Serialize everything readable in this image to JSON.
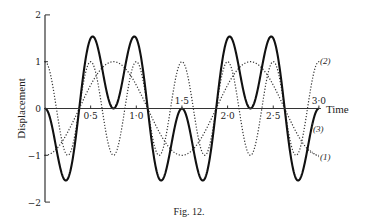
{
  "chart_data": {
    "type": "line",
    "title": "",
    "caption": "Fig. 12.",
    "xlabel": "Time",
    "ylabel": "Displacement",
    "xlim": [
      0,
      3.0
    ],
    "ylim": [
      -2,
      2
    ],
    "grid": false,
    "x_ticks": [
      {
        "value": 0.5,
        "label": "0·5",
        "placement": "below"
      },
      {
        "value": 1.0,
        "label": "1·0",
        "placement": "below"
      },
      {
        "value": 1.5,
        "label": "1·5",
        "placement": "above"
      },
      {
        "value": 2.0,
        "label": "2·0",
        "placement": "below"
      },
      {
        "value": 2.5,
        "label": "2·5",
        "placement": "below"
      },
      {
        "value": 3.0,
        "label": "3·0",
        "placement": "above"
      }
    ],
    "y_ticks": [
      {
        "value": 2,
        "label": "2"
      },
      {
        "value": 1,
        "label": "1"
      },
      {
        "value": 0,
        "label": "0"
      },
      {
        "value": -1,
        "label": "−1"
      },
      {
        "value": -2,
        "label": "−2"
      }
    ],
    "series": [
      {
        "name": "(1)",
        "label": "(1)",
        "style": "dotted",
        "formula": "-cos(4πt/3)",
        "amplitude": 1,
        "period": 1.5,
        "phase_sign": -1,
        "x": [
          0,
          0.375,
          0.75,
          1.125,
          1.5,
          1.875,
          2.25,
          2.625,
          3.0
        ],
        "y": [
          -1,
          0,
          1,
          0,
          -1,
          0,
          1,
          0,
          -1
        ]
      },
      {
        "name": "(2)",
        "label": "(2)",
        "style": "dotted",
        "formula": "cos(4πt)",
        "amplitude": 1,
        "period": 0.5,
        "phase_sign": 1,
        "x": [
          0,
          0.125,
          0.25,
          0.375,
          0.5,
          0.75,
          1.0,
          1.25,
          1.5,
          1.75,
          2.0,
          2.25,
          2.5,
          2.75,
          3.0
        ],
        "y": [
          1,
          0,
          -1,
          0,
          1,
          -1,
          1,
          -1,
          1,
          -1,
          1,
          -1,
          1,
          -1,
          1
        ]
      },
      {
        "name": "(3)",
        "label": "(3)",
        "style": "solid",
        "formula": "(1) + (2)",
        "x": [
          0,
          0.25,
          0.5,
          0.75,
          1.0,
          1.25,
          1.5,
          1.75,
          2.0,
          2.25,
          2.5,
          2.75,
          3.0
        ],
        "y": [
          0,
          -1.5,
          1.5,
          0,
          1.5,
          -1.5,
          0,
          -1.5,
          1.5,
          0,
          1.5,
          -1.5,
          0
        ]
      }
    ]
  }
}
